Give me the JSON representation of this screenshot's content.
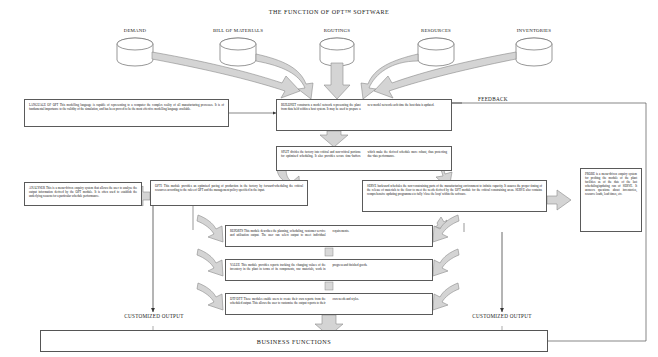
{
  "title": "THE FUNCTION OF OPT™ SOFTWARE",
  "colors": {
    "arrow_fill": "#d4d4d4",
    "arrow_stroke": "#8a8a8a",
    "box_stroke": "#5a5a5a",
    "line": "#555555",
    "text": "#1a1a1a",
    "background": "#ffffff"
  },
  "data_sources": [
    {
      "name": "demand",
      "label": "DEMAND"
    },
    {
      "name": "bill-of-materials",
      "label": "BILL OF MATERIALS"
    },
    {
      "name": "routings",
      "label": "ROUTINGS"
    },
    {
      "name": "resources",
      "label": "RESOURCES"
    },
    {
      "name": "inventories",
      "label": "INVENTORIES"
    }
  ],
  "modules": {
    "language": {
      "name": "language-of-opt",
      "text": "LANGUAGE OF OPT This modelling language is capable of representing to a computer the complex reality of all manufacturing processes. It is of fundamental importance to the validity of the simulation, and has been proved to be the most effective modelling language available."
    },
    "buildnet": {
      "name": "buildnet",
      "text": "BUILDNET constructs a model network representing the plant from data held within a host system. It may be used to prepare a new model network each time the host data is updated."
    },
    "split": {
      "name": "split",
      "text": "SPLIT divides the factory into critical and non-critical portions for optimised scheduling. It also provides secure time-buffers which make the derived schedule more robust, thus protecting due-date performance."
    },
    "analyser": {
      "name": "analyser",
      "text": "ANALYSER This is a menu-driven enquiry system that allows the user to analyse the output information derived by the OPT module. It is often used to establish the underlying reasons for a particular schedule performance."
    },
    "opt1": {
      "name": "opt1",
      "text": "OPT1 This module provides an optimised pacing of production in the factory by forward-scheduling the critical resources according to the rules of OPT and the management policy specified in the input."
    },
    "serve": {
      "name": "serve",
      "text": "SERVE backward schedules the non-constraining parts of the manufacturing environment to infinite capacity. It assures the proper timing of the release of materials to the floor to meet the needs derived by the OPT module for the critical constraining areas. SERVE also contains comprehensive updating programmes to fully 'close the loop' within the software."
    },
    "probe": {
      "name": "probe",
      "text": "PROBE is a menu-driven enquiry system for probing the module of the plant facilities as of the date of the last scheduling/updating run of SERVE. It answers questions about inventories, resource loads, lead times, etc."
    },
    "reports": {
      "name": "reports",
      "text": "REPORTS This module describes the planning, scheduling, customer service and utilisation output. The user can select output to meet individual requirements."
    },
    "value": {
      "name": "value",
      "text": "VALUE This module provides reports tracking the changing values of the inventory in the plant in terms of its components, raw materials, work in progress and finished goods."
    },
    "dtfdtt": {
      "name": "dtf-dtt",
      "text": "DTF/DTT These modules enable users to create their own reports from the scheduled output. This allows the user to customise the output reports to their own needs and styles."
    }
  },
  "labels": {
    "feedback": "FEEDBACK",
    "customized_output_left": "CUSTOMIZED OUTPUT",
    "customized_output_right": "CUSTOMIZED OUTPUT",
    "business_functions": "BUSINESS FUNCTIONS"
  }
}
